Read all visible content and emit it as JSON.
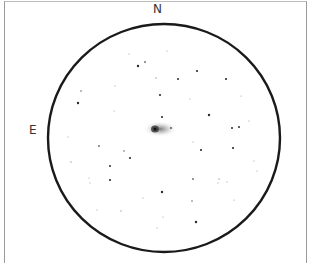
{
  "sketch": {
    "title": "Eyepiece field sketch",
    "orientation": {
      "north_label": "N",
      "east_label": "E"
    },
    "field_circle": {
      "cx": 164,
      "cy": 138,
      "rx": 116,
      "ry": 114,
      "stroke": "#1a1a1a"
    },
    "galaxy": {
      "cx": 155,
      "cy": 129,
      "core_color": "#2a2a2a",
      "halo_color": "#9a9a9a"
    },
    "stars": [
      {
        "x": 138,
        "y": 66,
        "r": 1.2
      },
      {
        "x": 145,
        "y": 62,
        "r": 0.9
      },
      {
        "x": 129,
        "y": 54,
        "r": 0.6
      },
      {
        "x": 167,
        "y": 51,
        "r": 0.6
      },
      {
        "x": 197,
        "y": 71,
        "r": 1.1
      },
      {
        "x": 226,
        "y": 79,
        "r": 1.1
      },
      {
        "x": 178,
        "y": 79,
        "r": 1.0
      },
      {
        "x": 156,
        "y": 78,
        "r": 0.7
      },
      {
        "x": 160,
        "y": 95,
        "r": 1.1
      },
      {
        "x": 81,
        "y": 91,
        "r": 0.8
      },
      {
        "x": 78,
        "y": 103,
        "r": 1.2
      },
      {
        "x": 190,
        "y": 99,
        "r": 0.6
      },
      {
        "x": 209,
        "y": 115,
        "r": 1.2
      },
      {
        "x": 162,
        "y": 117,
        "r": 1.1
      },
      {
        "x": 171,
        "y": 128,
        "r": 1.1
      },
      {
        "x": 232,
        "y": 128,
        "r": 1.0
      },
      {
        "x": 239,
        "y": 127,
        "r": 1.0
      },
      {
        "x": 233,
        "y": 148,
        "r": 1.1
      },
      {
        "x": 201,
        "y": 150,
        "r": 1.1
      },
      {
        "x": 193,
        "y": 142,
        "r": 0.6
      },
      {
        "x": 99,
        "y": 146,
        "r": 0.9
      },
      {
        "x": 124,
        "y": 151,
        "r": 0.8
      },
      {
        "x": 130,
        "y": 158,
        "r": 1.1
      },
      {
        "x": 71,
        "y": 162,
        "r": 0.7
      },
      {
        "x": 110,
        "y": 166,
        "r": 1.0
      },
      {
        "x": 110,
        "y": 180,
        "r": 1.1
      },
      {
        "x": 89,
        "y": 178,
        "r": 0.6
      },
      {
        "x": 90,
        "y": 183,
        "r": 0.6
      },
      {
        "x": 193,
        "y": 179,
        "r": 0.9
      },
      {
        "x": 219,
        "y": 179,
        "r": 0.7
      },
      {
        "x": 218,
        "y": 183,
        "r": 0.6
      },
      {
        "x": 227,
        "y": 182,
        "r": 0.6
      },
      {
        "x": 162,
        "y": 192,
        "r": 1.2
      },
      {
        "x": 192,
        "y": 201,
        "r": 0.8
      },
      {
        "x": 234,
        "y": 200,
        "r": 0.6
      },
      {
        "x": 97,
        "y": 210,
        "r": 0.6
      },
      {
        "x": 121,
        "y": 211,
        "r": 0.7
      },
      {
        "x": 196,
        "y": 222,
        "r": 1.2
      },
      {
        "x": 157,
        "y": 228,
        "r": 0.6
      },
      {
        "x": 163,
        "y": 217,
        "r": 0.6
      },
      {
        "x": 249,
        "y": 121,
        "r": 0.6
      },
      {
        "x": 241,
        "y": 96,
        "r": 0.6
      },
      {
        "x": 254,
        "y": 161,
        "r": 0.6
      },
      {
        "x": 257,
        "y": 171,
        "r": 0.6
      },
      {
        "x": 114,
        "y": 111,
        "r": 0.6
      },
      {
        "x": 115,
        "y": 86,
        "r": 0.6
      },
      {
        "x": 68,
        "y": 137,
        "r": 0.6
      },
      {
        "x": 143,
        "y": 198,
        "r": 0.6
      }
    ]
  }
}
